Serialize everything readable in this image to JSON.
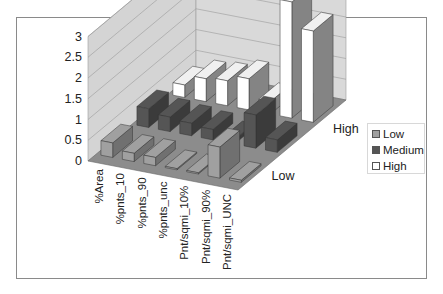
{
  "chart_data": {
    "type": "bar",
    "subtype": "3d-column",
    "title": "",
    "xlabel": "",
    "ylabel": "",
    "ylim": [
      0,
      3
    ],
    "yticks": [
      "0",
      "0.5",
      "1",
      "1.5",
      "2",
      "2.5",
      "3"
    ],
    "grid": true,
    "legend_position": "right",
    "depth_axis_labels": [
      "Low",
      "High"
    ],
    "categories": [
      "%Area",
      "%pnts_10",
      "%pnts_90",
      "%pnts_unc",
      "Pnt/sqmi_10%",
      "Pnt/sqmi_90%",
      "Pnt/sqmi_UNC"
    ],
    "series": [
      {
        "name": "Low",
        "color": "#a0a0a0",
        "values": [
          0.35,
          0.2,
          0.2,
          0.03,
          0.03,
          0.75,
          0.05
        ]
      },
      {
        "name": "Medium",
        "color": "#555555",
        "values": [
          0.45,
          0.35,
          0.3,
          0.25,
          0.1,
          0.8,
          0.3
        ]
      },
      {
        "name": "High",
        "color": "#ffffff",
        "values": [
          0.3,
          0.55,
          0.6,
          0.75,
          0.3,
          2.8,
          2.2
        ]
      }
    ]
  },
  "legend": {
    "items": [
      {
        "label": "Low",
        "color": "#a0a0a0"
      },
      {
        "label": "Medium",
        "color": "#555555"
      },
      {
        "label": "High",
        "color": "#ffffff"
      }
    ]
  },
  "depth_labels": {
    "front": "Low",
    "back": "High"
  }
}
